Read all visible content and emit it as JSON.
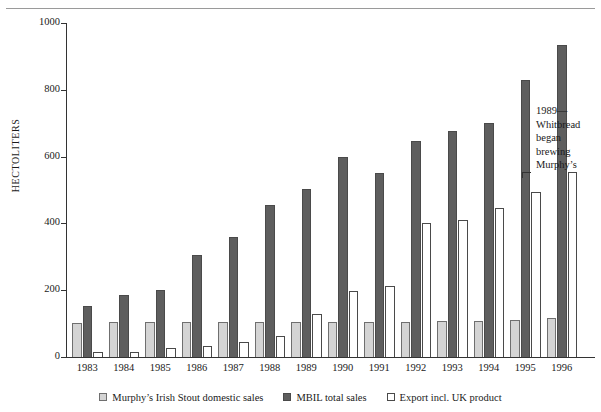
{
  "caption_clipped": "",
  "annotation": {
    "line1": "1989—",
    "line2": "Whitbread",
    "line3": "began",
    "line4": "brewing",
    "line5": "Murphy’s"
  },
  "legend": {
    "items": [
      {
        "label": "Murphy’s Irish Stout domestic sales",
        "swatch": "domestic",
        "color": "#d4d4d4"
      },
      {
        "label": "MBIL total sales",
        "swatch": "total",
        "color": "#5e5e5e"
      },
      {
        "label": "Export incl. UK product",
        "swatch": "export",
        "color": "#ffffff"
      }
    ]
  },
  "chart_data": {
    "type": "bar",
    "title": "",
    "xlabel": "",
    "ylabel": "HECTOLITERS",
    "ylim": [
      0,
      1000
    ],
    "yticks": [
      0,
      200,
      400,
      600,
      800,
      1000
    ],
    "ytick_labels": [
      "0",
      "200",
      "400",
      "600",
      "800",
      "1000"
    ],
    "grid": false,
    "legend_position": "bottom",
    "categories": [
      "1983",
      "1984",
      "1985",
      "1986",
      "1987",
      "1988",
      "1989",
      "1990",
      "1991",
      "1992",
      "1993",
      "1994",
      "1995",
      "1996"
    ],
    "series": [
      {
        "name": "Murphy’s Irish Stout domestic sales",
        "color": "#d4d4d4",
        "values": [
          103,
          105,
          105,
          105,
          105,
          105,
          105,
          105,
          105,
          105,
          107,
          108,
          110,
          118
        ]
      },
      {
        "name": "MBIL total sales",
        "color": "#5e5e5e",
        "values": [
          152,
          185,
          200,
          305,
          360,
          455,
          502,
          598,
          552,
          648,
          678,
          700,
          828,
          935
        ]
      },
      {
        "name": "Export incl. UK product",
        "color": "#ffffff",
        "values": [
          14,
          15,
          26,
          33,
          45,
          62,
          130,
          197,
          213,
          400,
          410,
          445,
          495,
          555
        ]
      }
    ],
    "annotation_note": "1989—Whitbread began brewing Murphy’s"
  }
}
